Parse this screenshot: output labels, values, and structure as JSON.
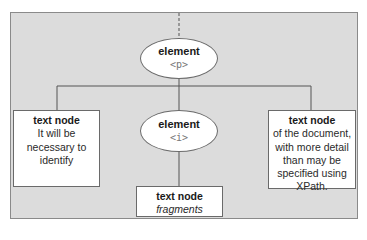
{
  "diagram": {
    "colors": {
      "panel_bg": "#dcdcdc",
      "node_bg": "#ffffff",
      "line": "#555555",
      "tag_text": "#777777"
    },
    "nodes": {
      "element_p": {
        "type": "element",
        "label": "element",
        "tag": "<p>"
      },
      "element_i": {
        "type": "element",
        "label": "element",
        "tag": "<i>"
      },
      "text_left": {
        "type": "text",
        "label": "text node",
        "lines": [
          "It will be",
          "necessary to",
          "identify"
        ]
      },
      "text_right": {
        "type": "text",
        "label": "text node",
        "lines": [
          "of the document,",
          "with more detail",
          "than may be",
          "specified using",
          "XPath."
        ]
      },
      "text_bottom": {
        "type": "text",
        "label": "text node",
        "lines": [
          "fragments"
        ]
      }
    },
    "edges": [
      {
        "from": "parent",
        "to": "element_p",
        "style": "dashed"
      },
      {
        "from": "element_p",
        "to": "text_left",
        "style": "solid"
      },
      {
        "from": "element_p",
        "to": "element_i",
        "style": "solid"
      },
      {
        "from": "element_p",
        "to": "text_right",
        "style": "solid"
      },
      {
        "from": "element_i",
        "to": "text_bottom",
        "style": "solid"
      }
    ]
  }
}
